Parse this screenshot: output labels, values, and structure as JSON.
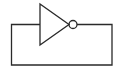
{
  "diagram": {
    "type": "inverter-feedback-loop",
    "components": [
      {
        "id": "inverter",
        "kind": "NOT gate",
        "has_output_bubble": true
      }
    ],
    "connections": [
      {
        "from": "inverter.output",
        "to": "inverter.input",
        "route": "external loop"
      }
    ],
    "colors": {
      "stroke": "#2a2a2a",
      "background": "#ffffff"
    }
  }
}
